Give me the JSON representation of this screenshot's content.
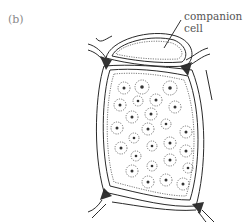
{
  "figure": {
    "panel_label": "(b)",
    "callout": {
      "line1": "companion",
      "line2": "cell"
    },
    "colors": {
      "ink": "#2a2a2a",
      "label_gray": "#8a8a8a",
      "background": "#ffffff"
    }
  }
}
